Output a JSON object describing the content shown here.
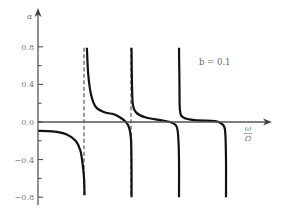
{
  "chart_data": {
    "type": "line",
    "title": "",
    "xlabel_numerator": "ω",
    "xlabel_denominator": "Ω",
    "ylabel": "α",
    "annotation": "b = 0.1",
    "xlim": [
      0,
      5
    ],
    "ylim": [
      -0.8,
      0.8
    ],
    "yticks": [
      0.8,
      0.4,
      0.0,
      -0.4,
      -0.8
    ],
    "ytick_labels": [
      "0.8",
      "0.4",
      "0.0",
      "−0.4",
      "−0.8"
    ],
    "yminor_ticks": [
      0.6,
      0.2,
      -0.2,
      -0.6
    ],
    "grid": false,
    "legend": "none",
    "dashed_verticals": [
      1,
      2
    ],
    "series": [
      {
        "name": "branch-1",
        "points": [
          [
            0,
            -0.095
          ],
          [
            0.3,
            -0.1
          ],
          [
            0.6,
            -0.13
          ],
          [
            0.8,
            -0.2
          ],
          [
            0.9,
            -0.3
          ],
          [
            0.95,
            -0.45
          ],
          [
            0.98,
            -0.6
          ],
          [
            0.99,
            -0.78
          ]
        ]
      },
      {
        "name": "branch-2",
        "points": [
          [
            1.04,
            0.79
          ],
          [
            1.07,
            0.5
          ],
          [
            1.13,
            0.29
          ],
          [
            1.23,
            0.16
          ],
          [
            1.43,
            0.1
          ],
          [
            1.6,
            0.085
          ],
          [
            1.74,
            0.05
          ],
          [
            1.87,
            0.0
          ],
          [
            1.94,
            -0.06
          ],
          [
            1.98,
            -0.19
          ],
          [
            1.99,
            -0.5
          ],
          [
            1.99,
            -0.8
          ]
        ]
      },
      {
        "name": "branch-3",
        "points": [
          [
            1.99,
            0.79
          ],
          [
            2.0,
            0.4
          ],
          [
            2.02,
            0.18
          ],
          [
            2.09,
            0.1
          ],
          [
            2.28,
            0.05
          ],
          [
            2.6,
            0.02
          ],
          [
            2.81,
            0.0
          ],
          [
            2.94,
            -0.04
          ],
          [
            2.98,
            -0.13
          ],
          [
            3.0,
            -0.4
          ],
          [
            3.0,
            -0.8
          ]
        ]
      },
      {
        "name": "branch-4",
        "points": [
          [
            3.0,
            0.79
          ],
          [
            3.01,
            0.4
          ],
          [
            3.02,
            0.13
          ],
          [
            3.09,
            0.05
          ],
          [
            3.34,
            0.02
          ],
          [
            3.77,
            0.01
          ],
          [
            3.91,
            -0.02
          ],
          [
            3.98,
            -0.09
          ],
          [
            4.0,
            -0.4
          ],
          [
            4.0,
            -0.8
          ]
        ]
      }
    ]
  }
}
